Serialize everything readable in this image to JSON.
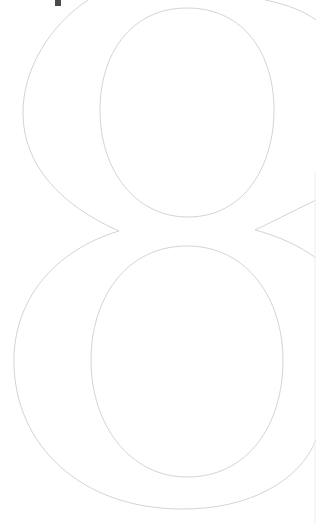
{
  "glyph": {
    "character": "8",
    "style": "outlined serif numeral",
    "stroke_color": "#d4d4d4",
    "background_color": "#ffffff"
  },
  "mark": {
    "color": "#4a4a4a"
  }
}
